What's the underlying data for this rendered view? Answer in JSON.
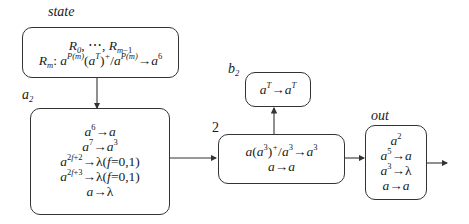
{
  "labels": {
    "state": "state",
    "a2": "a",
    "a2_sub": "2",
    "b2": "b",
    "b2_sub": "2",
    "edge_weight": "2",
    "out": "out"
  },
  "neurons": {
    "state": {
      "line1": "R₀, ⋯, R",
      "line1_sub": "m−1",
      "line2_R": "R",
      "line2_R_sub": "m",
      "line2_rule": ": a^P(m)(a^T)^+/a^P(m) → a^6"
    },
    "a2": {
      "rules": [
        "a^6 → a",
        "a^7 → a^3",
        "a^(2f+2) → λ (f = 0,1)",
        "a^(2f+3) → λ (f = 0,1)",
        "a → λ"
      ]
    },
    "b2": {
      "rules": [
        "a^T → a^T"
      ]
    },
    "middle": {
      "rules": [
        "a(a^3)^+/a^3 → a^3",
        "a → a"
      ]
    },
    "out": {
      "initial": "a^2",
      "rules": [
        "a^5 → a",
        "a^3 → λ",
        "a → a"
      ]
    }
  },
  "colors": {
    "stroke": "#333333",
    "text": "#1a1a1a",
    "background": "#ffffff"
  }
}
